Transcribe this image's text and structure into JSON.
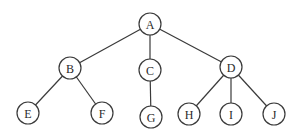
{
  "diagram": {
    "type": "tree",
    "root": "A",
    "node_radius": 11,
    "colors": {
      "stroke": "#3a3a3a",
      "fill": "#ffffff",
      "text": "#2a2a2a",
      "background": "#ffffff"
    },
    "nodes": [
      {
        "id": "A",
        "label": "A",
        "x": 150,
        "y": 24
      },
      {
        "id": "B",
        "label": "B",
        "x": 70,
        "y": 68
      },
      {
        "id": "C",
        "label": "C",
        "x": 150,
        "y": 70
      },
      {
        "id": "D",
        "label": "D",
        "x": 231,
        "y": 67
      },
      {
        "id": "E",
        "label": "E",
        "x": 28,
        "y": 113
      },
      {
        "id": "F",
        "label": "F",
        "x": 102,
        "y": 113
      },
      {
        "id": "G",
        "label": "G",
        "x": 151,
        "y": 117
      },
      {
        "id": "H",
        "label": "H",
        "x": 189,
        "y": 114
      },
      {
        "id": "I",
        "label": "I",
        "x": 231,
        "y": 114
      },
      {
        "id": "J",
        "label": "J",
        "x": 274,
        "y": 114
      }
    ],
    "edges": [
      {
        "from": "A",
        "to": "B"
      },
      {
        "from": "A",
        "to": "C"
      },
      {
        "from": "A",
        "to": "D"
      },
      {
        "from": "B",
        "to": "E"
      },
      {
        "from": "B",
        "to": "F"
      },
      {
        "from": "C",
        "to": "G"
      },
      {
        "from": "D",
        "to": "H"
      },
      {
        "from": "D",
        "to": "I"
      },
      {
        "from": "D",
        "to": "J"
      }
    ]
  }
}
